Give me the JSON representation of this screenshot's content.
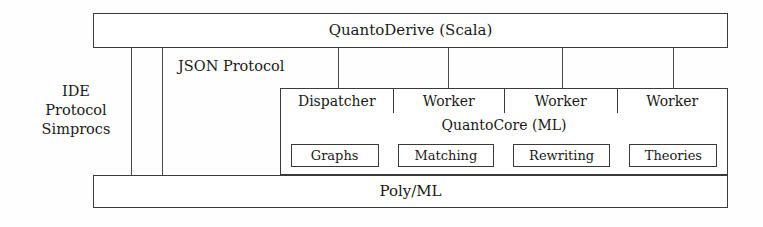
{
  "diagram": {
    "title_top": "QuantoDerive (Scala)",
    "title_bottom": "Poly/ML",
    "core_label": "QuantoCore (ML)",
    "json_protocol_label": "JSON Protocol",
    "left_label_lines": [
      "IDE",
      "Protocol",
      "Simprocs"
    ],
    "worker_row": [
      {
        "label": "Dispatcher"
      },
      {
        "label": "Worker"
      },
      {
        "label": "Worker"
      },
      {
        "label": "Worker"
      }
    ],
    "core_modules": [
      {
        "label": "Graphs"
      },
      {
        "label": "Matching"
      },
      {
        "label": "Rewriting"
      },
      {
        "label": "Theories"
      }
    ],
    "colors": {
      "background": "#fefefe",
      "stroke": "#3a3a3a",
      "text": "#1a1a1a",
      "connector": "#4a4a4a"
    }
  }
}
